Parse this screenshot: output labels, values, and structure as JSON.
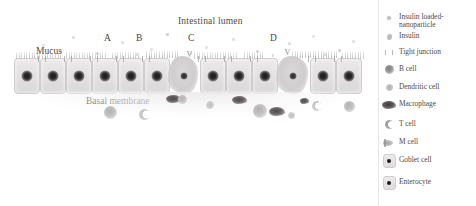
{
  "figure": {
    "labels": {
      "intestinal_lumen": "Intestinal lumen",
      "mucus": "Mucus",
      "basal_membrane": "Basal membrane"
    },
    "pathway_markers": [
      "A",
      "B",
      "C",
      "D"
    ]
  },
  "legend": {
    "items": [
      {
        "name": "insulin-loaded-nanoparticle",
        "label": "Insulin loaded-\nnanoparticle",
        "icon": "nanoparticle-icon"
      },
      {
        "name": "insulin",
        "label": "Insulin",
        "icon": "insulin-icon"
      },
      {
        "name": "tight-junction",
        "label": "Tight junction",
        "icon": "tight-junction-icon"
      },
      {
        "name": "b-cell",
        "label": "B cell",
        "icon": "b-cell-icon"
      },
      {
        "name": "dendritic-cell",
        "label": "Dendritic cell",
        "icon": "dendritic-cell-icon"
      },
      {
        "name": "macrophage",
        "label": "Macrophage",
        "icon": "macrophage-icon"
      },
      {
        "name": "t-cell",
        "label": "T cell",
        "icon": "t-cell-icon"
      },
      {
        "name": "m-cell",
        "label": "M cell",
        "icon": "m-cell-icon"
      },
      {
        "name": "goblet-cell",
        "label": "Goblet cell",
        "icon": "goblet-cell-icon"
      },
      {
        "name": "enterocyte",
        "label": "Enterocyte",
        "icon": "enterocyte-icon"
      }
    ]
  },
  "colors": {
    "background": "#ffffff",
    "text": "#4f4a45",
    "cell_fill": "#e4e2e3",
    "cell_border": "#cfcccd",
    "nucleus": "#1d1b1c",
    "macrophage": "#4a4748",
    "divider": "#e7e5e6"
  }
}
